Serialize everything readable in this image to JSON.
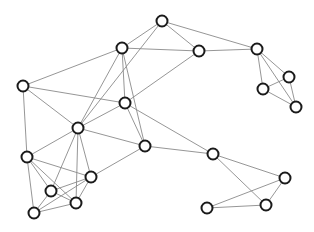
{
  "diagram": {
    "type": "undirected-network-graph",
    "canvas": {
      "width": 314,
      "height": 232,
      "background": "#ffffff"
    },
    "style": {
      "edge_color": "#8a8a8a",
      "node_fill": "#ffffff",
      "node_stroke": "#1a1a1a",
      "node_radius": 5.5
    },
    "nodes": [
      {
        "id": "A",
        "x": 162,
        "y": 21
      },
      {
        "id": "B",
        "x": 122,
        "y": 48
      },
      {
        "id": "C",
        "x": 199,
        "y": 51
      },
      {
        "id": "D",
        "x": 257,
        "y": 49
      },
      {
        "id": "E",
        "x": 289,
        "y": 77
      },
      {
        "id": "F",
        "x": 263,
        "y": 89
      },
      {
        "id": "G",
        "x": 296,
        "y": 107
      },
      {
        "id": "H",
        "x": 23,
        "y": 86
      },
      {
        "id": "I",
        "x": 125,
        "y": 103
      },
      {
        "id": "J",
        "x": 78,
        "y": 128
      },
      {
        "id": "K",
        "x": 145,
        "y": 146
      },
      {
        "id": "L",
        "x": 27,
        "y": 157
      },
      {
        "id": "M",
        "x": 213,
        "y": 154
      },
      {
        "id": "N",
        "x": 91,
        "y": 177
      },
      {
        "id": "O",
        "x": 51,
        "y": 191
      },
      {
        "id": "P",
        "x": 76,
        "y": 203
      },
      {
        "id": "Q",
        "x": 34,
        "y": 213
      },
      {
        "id": "R",
        "x": 285,
        "y": 178
      },
      {
        "id": "S",
        "x": 266,
        "y": 205
      },
      {
        "id": "T",
        "x": 207,
        "y": 208
      }
    ],
    "edges": [
      [
        "A",
        "B"
      ],
      [
        "A",
        "C"
      ],
      [
        "A",
        "D"
      ],
      [
        "A",
        "J"
      ],
      [
        "B",
        "C"
      ],
      [
        "B",
        "H"
      ],
      [
        "B",
        "I"
      ],
      [
        "B",
        "K"
      ],
      [
        "B",
        "J"
      ],
      [
        "C",
        "I"
      ],
      [
        "C",
        "D"
      ],
      [
        "D",
        "E"
      ],
      [
        "D",
        "F"
      ],
      [
        "D",
        "G"
      ],
      [
        "E",
        "F"
      ],
      [
        "E",
        "G"
      ],
      [
        "F",
        "G"
      ],
      [
        "H",
        "I"
      ],
      [
        "H",
        "L"
      ],
      [
        "H",
        "J"
      ],
      [
        "I",
        "J"
      ],
      [
        "I",
        "K"
      ],
      [
        "I",
        "M"
      ],
      [
        "J",
        "L"
      ],
      [
        "J",
        "N"
      ],
      [
        "J",
        "O"
      ],
      [
        "J",
        "P"
      ],
      [
        "J",
        "K"
      ],
      [
        "K",
        "N"
      ],
      [
        "K",
        "M"
      ],
      [
        "L",
        "N"
      ],
      [
        "L",
        "P"
      ],
      [
        "L",
        "Q"
      ],
      [
        "L",
        "O"
      ],
      [
        "N",
        "O"
      ],
      [
        "N",
        "Q"
      ],
      [
        "N",
        "P"
      ],
      [
        "O",
        "P"
      ],
      [
        "O",
        "Q"
      ],
      [
        "P",
        "Q"
      ],
      [
        "M",
        "R"
      ],
      [
        "M",
        "S"
      ],
      [
        "R",
        "T"
      ],
      [
        "R",
        "S"
      ],
      [
        "T",
        "S"
      ]
    ]
  }
}
